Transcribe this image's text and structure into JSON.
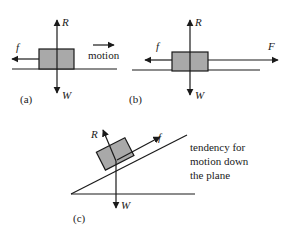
{
  "diagram": {
    "panels": [
      {
        "id": "a",
        "caption": "(a)",
        "forces": {
          "normal": "R",
          "weight": "W",
          "friction": "f"
        },
        "motion_label": "motion"
      },
      {
        "id": "b",
        "caption": "(b)",
        "forces": {
          "normal": "R",
          "weight": "W",
          "friction": "f",
          "applied": "F"
        }
      },
      {
        "id": "c",
        "caption": "(c)",
        "forces": {
          "normal": "R",
          "weight": "W",
          "friction": "f"
        },
        "note_lines": [
          "tendency for",
          "motion down",
          "the plane"
        ]
      }
    ],
    "colors": {
      "block": "#a9a9a9",
      "ink": "#1a1a1a"
    }
  }
}
